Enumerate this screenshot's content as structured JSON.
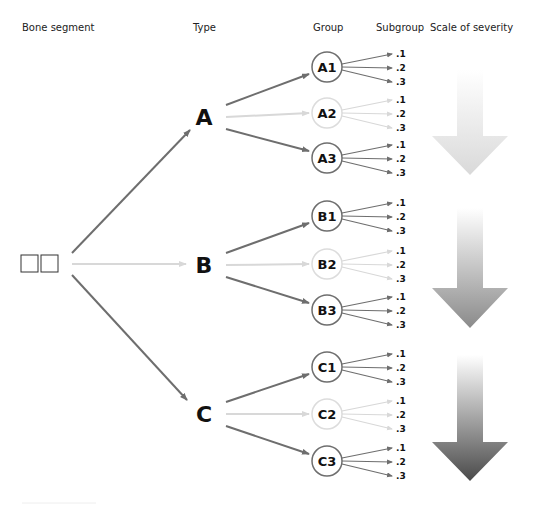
{
  "headers": {
    "bone_segment": "Bone segment",
    "type": "Type",
    "group": "Group",
    "subgroup": "Subgroup",
    "severity": "Scale of severity"
  },
  "colors": {
    "dark": "#6e6e6e",
    "light": "#d8d8d8",
    "text": "#111111"
  },
  "types": [
    {
      "label": "A",
      "groups": [
        {
          "label": "A1",
          "faded": false,
          "subgroups": [
            ".1",
            ".2",
            ".3"
          ]
        },
        {
          "label": "A2",
          "faded": true,
          "subgroups": [
            ".1",
            ".2",
            ".3"
          ]
        },
        {
          "label": "A3",
          "faded": false,
          "subgroups": [
            ".1",
            ".2",
            ".3"
          ]
        }
      ]
    },
    {
      "label": "B",
      "groups": [
        {
          "label": "B1",
          "faded": false,
          "subgroups": [
            ".1",
            ".2",
            ".3"
          ]
        },
        {
          "label": "B2",
          "faded": true,
          "subgroups": [
            ".1",
            ".2",
            ".3"
          ]
        },
        {
          "label": "B3",
          "faded": false,
          "subgroups": [
            ".1",
            ".2",
            ".3"
          ]
        }
      ]
    },
    {
      "label": "C",
      "groups": [
        {
          "label": "C1",
          "faded": false,
          "subgroups": [
            ".1",
            ".2",
            ".3"
          ]
        },
        {
          "label": "C2",
          "faded": true,
          "subgroups": [
            ".1",
            ".2",
            ".3"
          ]
        },
        {
          "label": "C3",
          "faded": false,
          "subgroups": [
            ".1",
            ".2",
            ".3"
          ]
        }
      ]
    }
  ],
  "severity_arrows": [
    {
      "name": "mild",
      "top": "#ffffff",
      "bottom": "#d9d9d9"
    },
    {
      "name": "moderate",
      "top": "#ffffff",
      "bottom": "#8a8a8a"
    },
    {
      "name": "severe",
      "top": "#ffffff",
      "bottom": "#4a4a4a"
    }
  ]
}
